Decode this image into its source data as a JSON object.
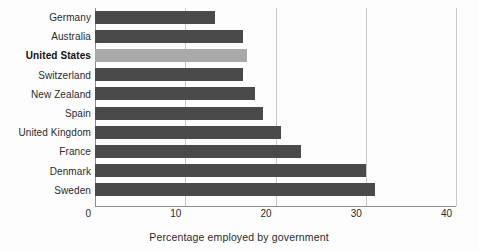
{
  "chart_data": {
    "type": "bar",
    "orientation": "horizontal",
    "title": "",
    "xlabel": "Percentage employed by government",
    "ylabel": "",
    "xlim": [
      0,
      40
    ],
    "xticks": [
      0,
      10,
      20,
      30,
      40
    ],
    "xtick_labels": [
      "0",
      "10",
      "20",
      "30",
      "40"
    ],
    "grid": "vertical",
    "legend": "none",
    "categories": [
      "Germany",
      "Australia",
      "United States",
      "Switzerland",
      "New Zealand",
      "Spain",
      "United Kingdom",
      "France",
      "Denmark",
      "Sweden"
    ],
    "values": [
      13.3,
      16.4,
      16.8,
      16.4,
      17.7,
      18.6,
      20.6,
      22.8,
      30.0,
      31.0
    ],
    "highlight_category": "United States",
    "bar_color": "#4a4a4a",
    "highlight_color": "#a9a9a9",
    "gridline_color": "#c9c9c9",
    "axis_color": "#8d8d8d",
    "background_color": "#fdfdfd",
    "text_color": "#2b2b2b"
  }
}
